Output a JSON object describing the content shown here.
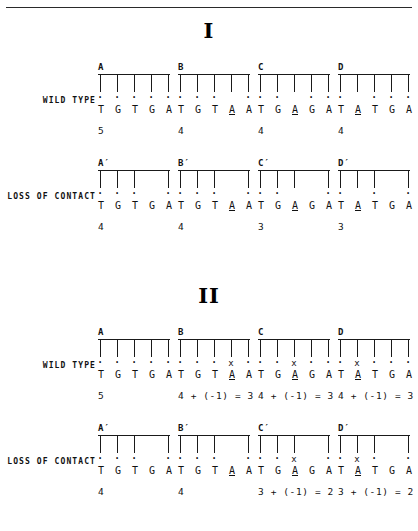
{
  "figure": {
    "title_rule": "horizontal-rule",
    "panels": [
      {
        "numeral": "I",
        "rows": [
          {
            "label": "WILD TYPE",
            "cells": [
              {
                "title": "A",
                "teeth": [
                  1,
                  1,
                  1,
                  1,
                  1
                ],
                "marks": [
                  "dot",
                  "dot",
                  "dot",
                  "dot",
                  "dot"
                ],
                "bases": [
                  "T",
                  "G",
                  "T",
                  "G",
                  "A"
                ],
                "mutated": [
                  false,
                  false,
                  false,
                  false,
                  false
                ],
                "score": "5"
              },
              {
                "title": "B",
                "teeth": [
                  1,
                  1,
                  1,
                  1,
                  1
                ],
                "marks": [
                  "dot",
                  "dot",
                  "dot",
                  "",
                  "dot"
                ],
                "bases": [
                  "T",
                  "G",
                  "T",
                  "A",
                  "A"
                ],
                "mutated": [
                  false,
                  false,
                  false,
                  true,
                  false
                ],
                "score": "4"
              },
              {
                "title": "C",
                "teeth": [
                  1,
                  1,
                  1,
                  1,
                  1
                ],
                "marks": [
                  "dot",
                  "dot",
                  "",
                  "dot",
                  "dot"
                ],
                "bases": [
                  "T",
                  "G",
                  "A",
                  "G",
                  "A"
                ],
                "mutated": [
                  false,
                  false,
                  true,
                  false,
                  false
                ],
                "score": "4"
              },
              {
                "title": "D",
                "teeth": [
                  1,
                  1,
                  1,
                  1,
                  1
                ],
                "marks": [
                  "dot",
                  "",
                  "dot",
                  "dot",
                  "dot"
                ],
                "bases": [
                  "T",
                  "A",
                  "T",
                  "G",
                  "A"
                ],
                "mutated": [
                  false,
                  true,
                  false,
                  false,
                  false
                ],
                "score": "4"
              }
            ]
          },
          {
            "label": "LOSS OF CONTACT",
            "cells": [
              {
                "title": "A′",
                "teeth": [
                  1,
                  1,
                  1,
                  0,
                  1
                ],
                "marks": [
                  "dot",
                  "dot",
                  "dot",
                  "",
                  "dot"
                ],
                "bases": [
                  "T",
                  "G",
                  "T",
                  "G",
                  "A"
                ],
                "mutated": [
                  false,
                  false,
                  false,
                  false,
                  false
                ],
                "score": "4"
              },
              {
                "title": "B′",
                "teeth": [
                  1,
                  1,
                  1,
                  0,
                  1
                ],
                "marks": [
                  "dot",
                  "dot",
                  "dot",
                  "",
                  "dot"
                ],
                "bases": [
                  "T",
                  "G",
                  "T",
                  "A",
                  "A"
                ],
                "mutated": [
                  false,
                  false,
                  false,
                  true,
                  false
                ],
                "score": "4"
              },
              {
                "title": "C′",
                "teeth": [
                  1,
                  1,
                  1,
                  0,
                  1
                ],
                "marks": [
                  "dot",
                  "dot",
                  "",
                  "",
                  "dot"
                ],
                "bases": [
                  "T",
                  "G",
                  "A",
                  "G",
                  "A"
                ],
                "mutated": [
                  false,
                  false,
                  true,
                  false,
                  false
                ],
                "score": "3"
              },
              {
                "title": "D′",
                "teeth": [
                  1,
                  1,
                  1,
                  0,
                  1
                ],
                "marks": [
                  "dot",
                  "",
                  "dot",
                  "",
                  "dot"
                ],
                "bases": [
                  "T",
                  "A",
                  "T",
                  "G",
                  "A"
                ],
                "mutated": [
                  false,
                  true,
                  false,
                  false,
                  false
                ],
                "score": "3"
              }
            ]
          }
        ]
      },
      {
        "numeral": "II",
        "rows": [
          {
            "label": "WILD TYPE",
            "cells": [
              {
                "title": "A",
                "teeth": [
                  1,
                  1,
                  1,
                  1,
                  1
                ],
                "marks": [
                  "dot",
                  "dot",
                  "dot",
                  "dot",
                  "dot"
                ],
                "bases": [
                  "T",
                  "G",
                  "T",
                  "G",
                  "A"
                ],
                "mutated": [
                  false,
                  false,
                  false,
                  false,
                  false
                ],
                "score": "5"
              },
              {
                "title": "B",
                "teeth": [
                  1,
                  1,
                  1,
                  1,
                  1
                ],
                "marks": [
                  "dot",
                  "dot",
                  "dot",
                  "x",
                  "dot"
                ],
                "bases": [
                  "T",
                  "G",
                  "T",
                  "A",
                  "A"
                ],
                "mutated": [
                  false,
                  false,
                  false,
                  true,
                  false
                ],
                "score": "4 + (-1) = 3"
              },
              {
                "title": "C",
                "teeth": [
                  1,
                  1,
                  1,
                  1,
                  1
                ],
                "marks": [
                  "dot",
                  "dot",
                  "x",
                  "dot",
                  "dot"
                ],
                "bases": [
                  "T",
                  "G",
                  "A",
                  "G",
                  "A"
                ],
                "mutated": [
                  false,
                  false,
                  true,
                  false,
                  false
                ],
                "score": "4 + (-1) = 3"
              },
              {
                "title": "D",
                "teeth": [
                  1,
                  1,
                  1,
                  1,
                  1
                ],
                "marks": [
                  "dot",
                  "x",
                  "dot",
                  "dot",
                  "dot"
                ],
                "bases": [
                  "T",
                  "A",
                  "T",
                  "G",
                  "A"
                ],
                "mutated": [
                  false,
                  true,
                  false,
                  false,
                  false
                ],
                "score": "4 + (-1) = 3"
              }
            ]
          },
          {
            "label": "LOSS OF CONTACT",
            "cells": [
              {
                "title": "A′",
                "teeth": [
                  1,
                  1,
                  1,
                  0,
                  1
                ],
                "marks": [
                  "dot",
                  "dot",
                  "dot",
                  "",
                  "dot"
                ],
                "bases": [
                  "T",
                  "G",
                  "T",
                  "G",
                  "A"
                ],
                "mutated": [
                  false,
                  false,
                  false,
                  false,
                  false
                ],
                "score": "4"
              },
              {
                "title": "B′",
                "teeth": [
                  1,
                  1,
                  1,
                  0,
                  1
                ],
                "marks": [
                  "dot",
                  "dot",
                  "dot",
                  "",
                  "dot"
                ],
                "bases": [
                  "T",
                  "G",
                  "T",
                  "A",
                  "A"
                ],
                "mutated": [
                  false,
                  false,
                  false,
                  true,
                  false
                ],
                "score": "4"
              },
              {
                "title": "C′",
                "teeth": [
                  1,
                  1,
                  1,
                  0,
                  1
                ],
                "marks": [
                  "dot",
                  "dot",
                  "x",
                  "",
                  "dot"
                ],
                "bases": [
                  "T",
                  "G",
                  "A",
                  "G",
                  "A"
                ],
                "mutated": [
                  false,
                  false,
                  true,
                  false,
                  false
                ],
                "score": "3 + (-1) = 2"
              },
              {
                "title": "D′",
                "teeth": [
                  1,
                  1,
                  1,
                  0,
                  1
                ],
                "marks": [
                  "dot",
                  "x",
                  "dot",
                  "",
                  "dot"
                ],
                "bases": [
                  "T",
                  "A",
                  "T",
                  "G",
                  "A"
                ],
                "mutated": [
                  false,
                  true,
                  false,
                  false,
                  false
                ],
                "score": "3 + (-1) = 2"
              }
            ]
          }
        ]
      }
    ],
    "glyphs": {
      "dot": "·",
      "x": "x"
    }
  }
}
